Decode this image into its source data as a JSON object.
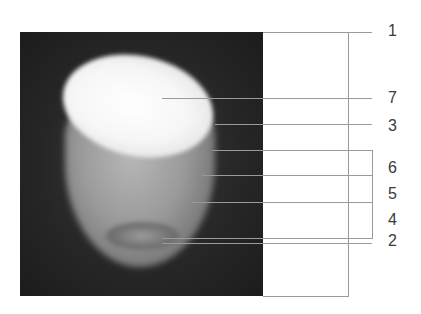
{
  "figure": {
    "labels": [
      {
        "id": "1",
        "text": "1"
      },
      {
        "id": "7",
        "text": "7"
      },
      {
        "id": "3",
        "text": "3"
      },
      {
        "id": "6",
        "text": "6"
      },
      {
        "id": "5",
        "text": "5"
      },
      {
        "id": "4",
        "text": "4"
      },
      {
        "id": "2",
        "text": "2"
      }
    ],
    "colors": {
      "background": "#ffffff",
      "photo_background": "#262626",
      "leader_line": "#9a9a9a",
      "label_text": "#3a3a3a"
    }
  }
}
